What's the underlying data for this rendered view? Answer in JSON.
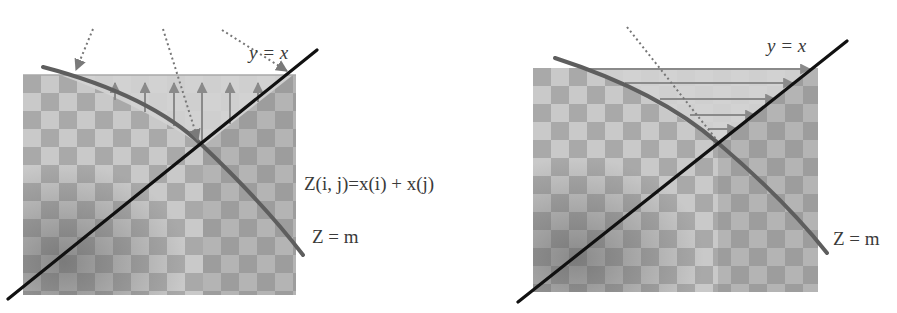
{
  "diagram": {
    "type": "two-panel geometric illustration of the 2D search space for pair sums",
    "colors": {
      "background": "#ffffff",
      "checker_light": "#c9c9c9",
      "checker_dark": "#a6a6a6",
      "shaded_region": "#cfcfcf",
      "curve": "#5e5e5e",
      "diagonal": "#111111",
      "arrow": "#8a8a8a",
      "dotted": "#777777",
      "text": "#3a3a3a"
    },
    "left_panel": {
      "diagonal_label": "y = x",
      "sum_label": "Z(i, j)=x(i) + x(j)",
      "curve_label": "Z = m",
      "arrow_direction": "vertical (upward)",
      "vertical_arrow_count": 6,
      "dotted_arrow_count": 3
    },
    "right_panel": {
      "diagonal_label": "y = x",
      "curve_label": "Z = m",
      "arrow_direction": "horizontal (rightward)",
      "horizontal_arrow_count": 5,
      "dotted_line_count": 1
    }
  }
}
